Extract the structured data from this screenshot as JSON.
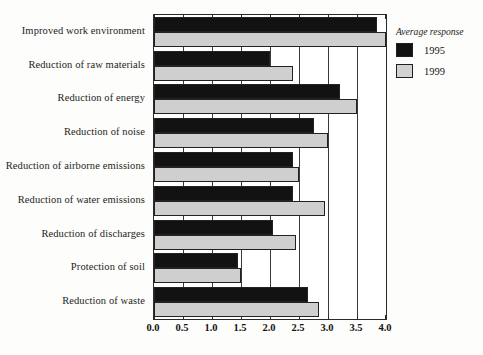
{
  "chart_data": {
    "type": "bar",
    "orientation": "horizontal",
    "title": "",
    "xlabel": "",
    "ylabel": "",
    "xlim": [
      0.0,
      4.0
    ],
    "xticks": [
      "0.0",
      "0.5",
      "1.0",
      "1.5",
      "2.0",
      "2.5",
      "3.0",
      "3.5",
      "4.0"
    ],
    "xtick_values": [
      0.0,
      0.5,
      1.0,
      1.5,
      2.0,
      2.5,
      3.0,
      3.5,
      4.0
    ],
    "grid": true,
    "grid_axis": "x",
    "legend_position": "outside-top-right",
    "legend_title": "Average response",
    "categories": [
      "Improved work environment",
      "Reduction of raw materials",
      "Reduction of energy",
      "Reduction of noise",
      "Reduction of airborne emissions",
      "Reduction of water emissions",
      "Reduction of discharges",
      "Protection of soil",
      "Reduction of waste"
    ],
    "series": [
      {
        "name": "1995",
        "color": "#121212",
        "values": [
          3.85,
          2.0,
          3.2,
          2.75,
          2.4,
          2.4,
          2.05,
          1.45,
          2.65
        ]
      },
      {
        "name": "1999",
        "color": "#cfcfcf",
        "values": [
          4.0,
          2.4,
          3.5,
          3.0,
          2.5,
          2.95,
          2.45,
          1.5,
          2.85
        ]
      }
    ]
  },
  "legend": {
    "title": "Average response",
    "entries": [
      {
        "label": "1995",
        "swatch": "black-swatch"
      },
      {
        "label": "1999",
        "swatch": "gray-swatch"
      }
    ]
  },
  "colors": {
    "series_1995": "#121212",
    "series_1999": "#cfcfcf",
    "axis": "#2b2b2b",
    "background": "#fdfdfb"
  }
}
